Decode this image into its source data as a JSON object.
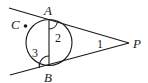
{
  "diagram": {
    "type": "geometry",
    "points": {
      "A": {
        "label": "A"
      },
      "B": {
        "label": "B"
      },
      "C": {
        "label": "C"
      },
      "P": {
        "label": "P"
      }
    },
    "angles": [
      {
        "label": "1",
        "at": "P"
      },
      {
        "label": "2",
        "at": "A"
      },
      {
        "label": "3",
        "at": "B"
      }
    ],
    "colors": {
      "ink": "#1a1a1a",
      "background": "#ffffff"
    }
  }
}
